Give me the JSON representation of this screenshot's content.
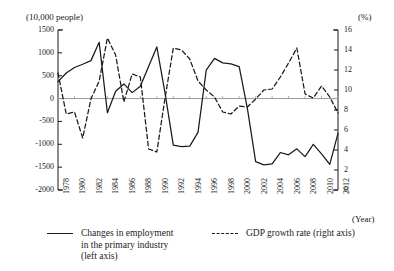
{
  "chart_data": {
    "type": "line",
    "title": "",
    "xlabel": "(Year)",
    "ylabel_left": "(10,000 people)",
    "ylabel_right": "(%)",
    "grid": false,
    "legend_position": "bottom",
    "x": [
      1978,
      1979,
      1980,
      1981,
      1982,
      1983,
      1984,
      1985,
      1986,
      1987,
      1988,
      1989,
      1990,
      1991,
      1992,
      1993,
      1994,
      1995,
      1996,
      1997,
      1998,
      1999,
      2000,
      2001,
      2002,
      2003,
      2004,
      2005,
      2006,
      2007,
      2008,
      2009,
      2010,
      2011,
      2012
    ],
    "x_tick_labels": [
      "1978",
      "1980",
      "1982",
      "1984",
      "1986",
      "1988",
      "1990",
      "1992",
      "1994",
      "1996",
      "1998",
      "2000",
      "2002",
      "2004",
      "2006",
      "2008",
      "2010",
      "2012"
    ],
    "y_left_ticks": [
      1500,
      1000,
      500,
      0,
      -500,
      -1000,
      -1500,
      -2000
    ],
    "y_right_ticks": [
      16,
      14,
      12,
      10,
      8,
      6,
      4,
      2,
      0
    ],
    "ylim_left": [
      -2000,
      1500
    ],
    "ylim_right": [
      0,
      16
    ],
    "series": [
      {
        "name": "Changes in employment in the primary industry (left axis)",
        "legend_label_lines": [
          "Changes in employment",
          "in the primary industry",
          "(left axis)"
        ],
        "axis": "left",
        "style": "solid",
        "color": "#1a1a1a",
        "values": [
          370,
          560,
          680,
          750,
          830,
          1230,
          -310,
          160,
          320,
          130,
          270,
          700,
          1130,
          120,
          -1020,
          -1050,
          -1040,
          -740,
          620,
          880,
          780,
          760,
          700,
          -220,
          -1380,
          -1450,
          -1430,
          -1180,
          -1230,
          -1100,
          -1270,
          -1000,
          -1210,
          -1440,
          -760
        ]
      },
      {
        "name": "GDP growth rate (right axis)",
        "legend_label_lines": [
          "GDP growth rate (right axis)"
        ],
        "axis": "right",
        "style": "dashed",
        "color": "#1a1a1a",
        "values": [
          11.7,
          7.6,
          7.8,
          5.2,
          9.1,
          10.9,
          15.2,
          13.5,
          8.8,
          11.6,
          11.3,
          4.1,
          3.8,
          9.2,
          14.2,
          14.0,
          13.1,
          10.9,
          10.0,
          9.3,
          7.8,
          7.6,
          8.4,
          8.3,
          9.1,
          10.0,
          10.1,
          11.3,
          12.7,
          14.2,
          9.6,
          9.2,
          10.4,
          9.3,
          7.7
        ]
      }
    ]
  },
  "legend": {
    "solid_lines": [
      "Changes in employment",
      "in the primary industry",
      "(left axis)"
    ],
    "dashed_lines": [
      "GDP growth rate (right axis)"
    ]
  },
  "axes": {
    "left_unit": "(10,000 people)",
    "right_unit": "(%)",
    "x_unit": "(Year)"
  }
}
